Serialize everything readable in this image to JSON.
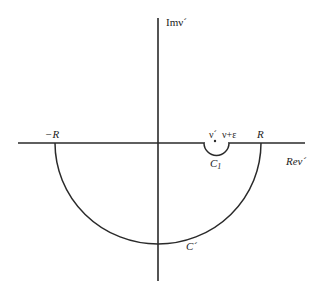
{
  "diagram": {
    "axes": {
      "vertical_label": "Imν´",
      "horizontal_label": "Reν´"
    },
    "points": {
      "neg_R": "−R",
      "pos_R": "R",
      "nu_prime": "ν´",
      "nu_eps": "ν+ε"
    },
    "contours": {
      "small": "C",
      "small_sub": "1",
      "large": "C´"
    },
    "colors": {
      "stroke": "#2a2a2a",
      "background": "#ffffff"
    }
  }
}
